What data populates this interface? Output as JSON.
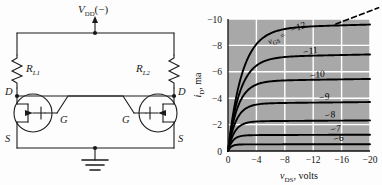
{
  "figure": {
    "left_panel_name": "flip-flop-fet-circuit",
    "right_panel_name": "fet-drain-characteristics-chart"
  },
  "circuit": {
    "supply_label": "V",
    "supply_sub": "DD",
    "supply_paren": "(−)",
    "resistor1_label": "R",
    "resistor1_sub": "L1",
    "resistor2_label": "R",
    "resistor2_sub": "L2",
    "fet1": {
      "drain": "D",
      "gate": "G",
      "source": "S"
    },
    "fet2": {
      "drain": "D",
      "gate": "G",
      "source": "S"
    },
    "ground_name": "ground-symbol",
    "wire_color": "#1a1a1a"
  },
  "chart_data": {
    "type": "line",
    "title": "",
    "xlabel": "v",
    "xlabel_sub": "DS",
    "xlabel_unit": ", volts",
    "ylabel": "i",
    "ylabel_sub": "D",
    "ylabel_unit": ", ma",
    "xticks": [
      0,
      -4,
      -8,
      -12,
      -16,
      -20
    ],
    "xtick_labels": [
      "0",
      "−4",
      "−8",
      "−12",
      "−16",
      "−20"
    ],
    "yticks": [
      0,
      -2,
      -4,
      -6,
      -8,
      -10
    ],
    "ytick_labels": [
      "0",
      "−2",
      "−4",
      "−6",
      "−8",
      "−10"
    ],
    "xlim": [
      0,
      -20
    ],
    "ylim": [
      0,
      -10
    ],
    "grid": true,
    "grid_color": "#ffffff",
    "plot_bg": "#a8a8a8",
    "curve_color": "#000000",
    "legend_position": "inline-curve-labels",
    "series_label_prefix": "v",
    "series_label_prefix_sub": "GS",
    "series_label_equals": " = ",
    "series": [
      {
        "name": "−12",
        "vgs": -12,
        "isat": -9.3,
        "knee_v": -4.6,
        "label": "−12",
        "label_x": -10.0,
        "label_y": -9.15,
        "has_prefix_label": true,
        "dashed_extension": true
      },
      {
        "name": "−11",
        "vgs": -11,
        "isat": -7.1,
        "knee_v": -3.9,
        "label": "−11",
        "label_x": -11.6,
        "label_y": -7.35,
        "has_prefix_label": false,
        "dashed_extension": false
      },
      {
        "name": "−10",
        "vgs": -10,
        "isat": -5.3,
        "knee_v": -3.2,
        "label": "−10",
        "label_x": -12.6,
        "label_y": -5.55,
        "has_prefix_label": false,
        "dashed_extension": false
      },
      {
        "name": "−9",
        "vgs": -9,
        "isat": -3.6,
        "knee_v": -2.6,
        "label": "−9",
        "label_x": -13.6,
        "label_y": -3.85,
        "has_prefix_label": false,
        "dashed_extension": false
      },
      {
        "name": "−8",
        "vgs": -8,
        "isat": -2.25,
        "knee_v": -2.1,
        "label": "−8",
        "label_x": -14.4,
        "label_y": -2.5,
        "has_prefix_label": false,
        "dashed_extension": false
      },
      {
        "name": "−7",
        "vgs": -7,
        "isat": -1.2,
        "knee_v": -1.5,
        "label": "−7",
        "label_x": -15.2,
        "label_y": -1.45,
        "has_prefix_label": false,
        "dashed_extension": false
      },
      {
        "name": "−6",
        "vgs": -6,
        "isat": -0.5,
        "knee_v": -1.0,
        "label": "−6",
        "label_x": -15.6,
        "label_y": -0.72,
        "has_prefix_label": false,
        "dashed_extension": false
      }
    ],
    "prefix_label_x": -7.0,
    "prefix_label_y": -8.35
  }
}
